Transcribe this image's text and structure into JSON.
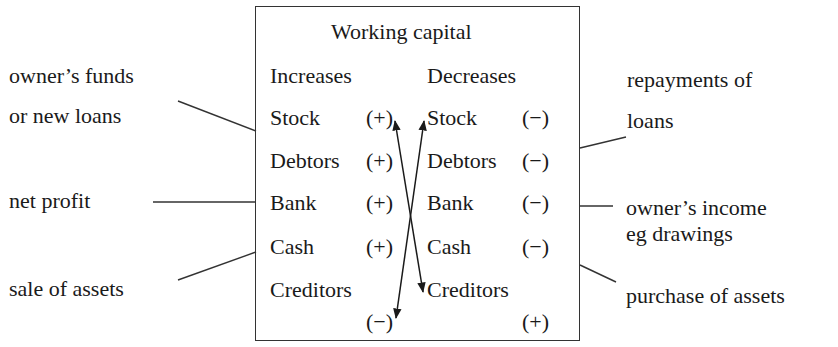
{
  "diagram": {
    "title": "Working capital",
    "columns": {
      "left": "Increases",
      "right": "Decreases"
    },
    "rows": [
      {
        "left_item": "Stock",
        "left_sign": "(+)",
        "right_item": "Stock",
        "right_sign": "(−)"
      },
      {
        "left_item": "Debtors",
        "left_sign": "(+)",
        "right_item": "Debtors",
        "right_sign": "(−)"
      },
      {
        "left_item": "Bank",
        "left_sign": "(+)",
        "right_item": "Bank",
        "right_sign": "(−)"
      },
      {
        "left_item": "Cash",
        "left_sign": "(+)",
        "right_item": "Cash",
        "right_sign": "(−)"
      },
      {
        "left_item": "Creditors",
        "left_sign": "(−)",
        "right_item": "Creditors",
        "right_sign": "(+)"
      }
    ],
    "sources": [
      {
        "line1": "owner’s funds",
        "line2": "or new loans"
      },
      {
        "line1": "net profit"
      },
      {
        "line1": "sale of assets"
      }
    ],
    "uses": [
      {
        "line1": "repayments of",
        "line2": "loans"
      },
      {
        "line1": "owner’s income",
        "line2": "eg drawings"
      },
      {
        "line1": "purchase of assets"
      }
    ],
    "arrows": [
      {
        "from": "Stock (+)",
        "to": "Creditors (decrease column)",
        "note": "double-headed"
      },
      {
        "from": "Stock (decrease column)",
        "to": "Creditors (−)",
        "note": "double-headed"
      }
    ],
    "colors": {
      "ink": "#1a1a1a",
      "background": "#ffffff"
    }
  }
}
